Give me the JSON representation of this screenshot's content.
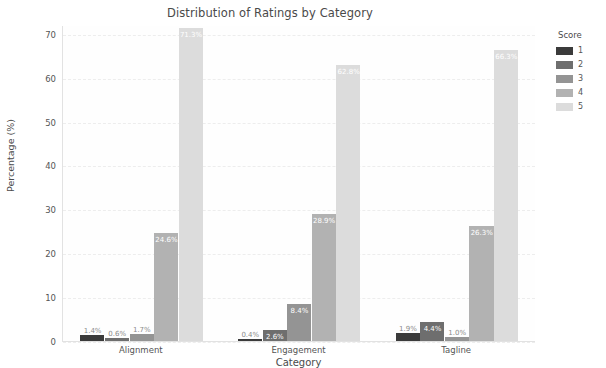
{
  "chart_data": {
    "type": "bar",
    "title": "Distribution of Ratings by Category",
    "xlabel": "Category",
    "ylabel": "Percentage (%)",
    "categories": [
      "Alignment",
      "Engagement",
      "Tagline"
    ],
    "ylim": [
      0,
      72
    ],
    "yticks": [
      0,
      10,
      20,
      30,
      40,
      50,
      60,
      70
    ],
    "grid": true,
    "legend_title": "Score",
    "legend_position": "right",
    "series": [
      {
        "name": "1",
        "color": "#3b3b3b",
        "values": [
          1.4,
          0.4,
          1.9
        ],
        "labels": [
          "1.4%",
          "0.4%",
          "1.9%"
        ]
      },
      {
        "name": "2",
        "color": "#6e6e6e",
        "values": [
          0.6,
          2.6,
          4.4
        ],
        "labels": [
          "0.6%",
          "2.6%",
          "4.4%"
        ]
      },
      {
        "name": "3",
        "color": "#949494",
        "values": [
          1.7,
          8.4,
          1.0
        ],
        "labels": [
          "1.7%",
          "8.4%",
          "1.0%"
        ]
      },
      {
        "name": "4",
        "color": "#b2b2b2",
        "values": [
          24.6,
          28.9,
          26.3
        ],
        "labels": [
          "24.6%",
          "28.9%",
          "26.3%"
        ]
      },
      {
        "name": "5",
        "color": "#dcdcdc",
        "values": [
          71.3,
          62.8,
          66.3
        ],
        "labels": [
          "71.3%",
          "62.8%",
          "66.3%"
        ]
      }
    ]
  }
}
